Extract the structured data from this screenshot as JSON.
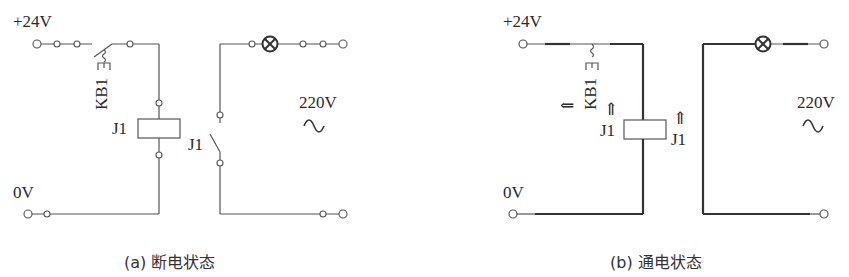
{
  "figure": {
    "panels": [
      {
        "id": "a",
        "state": "de-energized",
        "caption": "(a) 断电状态",
        "labels": {
          "supply_pos": "+24V",
          "supply_neg": "0V",
          "button": "KB1",
          "coil": "J1",
          "contact": "J1",
          "ac_voltage": "220V",
          "ac_symbol": "∼"
        },
        "switch_kb1": "open",
        "contact_j1": "open",
        "lamp": "off"
      },
      {
        "id": "b",
        "state": "energized",
        "caption": "(b) 通电状态",
        "labels": {
          "supply_pos": "+24V",
          "supply_neg": "0V",
          "button": "KB1",
          "coil": "J1",
          "contact": "J1",
          "ac_voltage": "220V",
          "ac_symbol": "∼"
        },
        "arrows": [
          "⇐",
          "⇑",
          "⇑"
        ],
        "switch_kb1": "closed",
        "contact_j1": "closed",
        "lamp": "on"
      }
    ]
  },
  "colors": {
    "wire": "#555555",
    "wire_energized": "#333333",
    "text": "#2a2a2a",
    "background": "#ffffff"
  }
}
